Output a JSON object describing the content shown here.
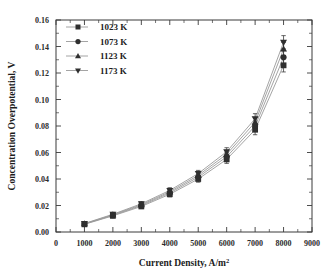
{
  "chart_data": {
    "type": "line",
    "title": "",
    "xlabel": "Current Density, A/m",
    "xlabel_superscript": "2",
    "xlabel_full": "Current Density, A/m2",
    "ylabel": "Concentration Overpotential, V",
    "xlim": [
      0,
      9000
    ],
    "ylim": [
      0.0,
      0.16
    ],
    "xticks": [
      0,
      1000,
      2000,
      3000,
      4000,
      5000,
      6000,
      7000,
      8000,
      9000
    ],
    "xtick_labels": [
      "0",
      "1000",
      "2000",
      "3000",
      "4000",
      "5000",
      "6000",
      "7000",
      "8000",
      "9000"
    ],
    "yticks": [
      0.0,
      0.02,
      0.04,
      0.06,
      0.08,
      0.1,
      0.12,
      0.14,
      0.16
    ],
    "ytick_labels": [
      "0.00",
      "0.02",
      "0.04",
      "0.06",
      "0.08",
      "0.10",
      "0.12",
      "0.14",
      "0.16"
    ],
    "grid": false,
    "legend_position": "top-left",
    "x": [
      1000,
      2000,
      3000,
      4000,
      5000,
      6000,
      7000,
      8000
    ],
    "series": [
      {
        "name": "1023 K",
        "marker": "square",
        "color": "#2f2f2f",
        "values": [
          0.0058,
          0.0122,
          0.0193,
          0.0285,
          0.04,
          0.0548,
          0.0772,
          0.1258
        ],
        "errors": [
          0.0012,
          0.0014,
          0.0016,
          0.002,
          0.0024,
          0.003,
          0.0038,
          0.005
        ]
      },
      {
        "name": "1073 K",
        "marker": "circle",
        "color": "#2f2f2f",
        "values": [
          0.006,
          0.0126,
          0.02,
          0.0295,
          0.0414,
          0.0568,
          0.08,
          0.1318
        ],
        "errors": [
          0.0012,
          0.0014,
          0.0016,
          0.002,
          0.0024,
          0.003,
          0.0038,
          0.005
        ]
      },
      {
        "name": "1123 K",
        "marker": "triangle-up",
        "color": "#2f2f2f",
        "values": [
          0.0062,
          0.013,
          0.0206,
          0.0304,
          0.0427,
          0.0587,
          0.0828,
          0.138
        ],
        "errors": [
          0.0012,
          0.0014,
          0.0016,
          0.002,
          0.0024,
          0.003,
          0.0038,
          0.005
        ]
      },
      {
        "name": "1173 K",
        "marker": "triangle-down",
        "color": "#2f2f2f",
        "values": [
          0.0064,
          0.0134,
          0.0213,
          0.0314,
          0.0441,
          0.0606,
          0.0855,
          0.1432
        ],
        "errors": [
          0.0012,
          0.0014,
          0.0016,
          0.002,
          0.0024,
          0.003,
          0.0038,
          0.005
        ]
      }
    ]
  },
  "legend": {
    "items": [
      {
        "label": "1023 K",
        "marker": "square"
      },
      {
        "label": "1073 K",
        "marker": "circle"
      },
      {
        "label": "1123 K",
        "marker": "triangle-up"
      },
      {
        "label": "1173 K",
        "marker": "triangle-down"
      }
    ]
  },
  "colors": {
    "axis": "#3a3a3a",
    "marker": "#2f2f2f",
    "line": "#9a9a9a",
    "text": "#1c1c1c",
    "background": "#ffffff"
  }
}
